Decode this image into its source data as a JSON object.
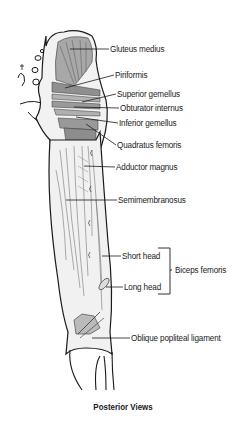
{
  "figure": {
    "caption": "Posterior Views",
    "colors": {
      "outline": "#1a1a1a",
      "muscle_fill": "#9a9a9a",
      "muscle_light": "#c8c8c8",
      "bone_fill": "#eeeeee",
      "background": "#ffffff"
    }
  },
  "labels": [
    {
      "id": "gluteus-medius",
      "text": "Gluteus medius",
      "x": 110,
      "y": 44
    },
    {
      "id": "piriformis",
      "text": "Piriformis",
      "x": 115,
      "y": 70
    },
    {
      "id": "superior-gemellus",
      "text": "Superior gemellus",
      "x": 117,
      "y": 89
    },
    {
      "id": "obturator-internus",
      "text": "Obturator internus",
      "x": 120,
      "y": 103
    },
    {
      "id": "inferior-gemellus",
      "text": "Inferior gemellus",
      "x": 119,
      "y": 118
    },
    {
      "id": "quadratus-femoris",
      "text": "Quadratus femoris",
      "x": 117,
      "y": 140
    },
    {
      "id": "adductor-magnus",
      "text": "Adductor magnus",
      "x": 116,
      "y": 162
    },
    {
      "id": "semimembranosus",
      "text": "Semimembranosus",
      "x": 118,
      "y": 195
    },
    {
      "id": "short-head",
      "text": "Short head",
      "x": 122,
      "y": 251
    },
    {
      "id": "long-head",
      "text": "Long head",
      "x": 124,
      "y": 282
    },
    {
      "id": "biceps-femoris",
      "text": "Biceps femoris",
      "x": 175,
      "y": 265
    },
    {
      "id": "oblique-popliteal-ligament",
      "text": "Oblique popliteal ligament",
      "x": 131,
      "y": 333
    }
  ]
}
